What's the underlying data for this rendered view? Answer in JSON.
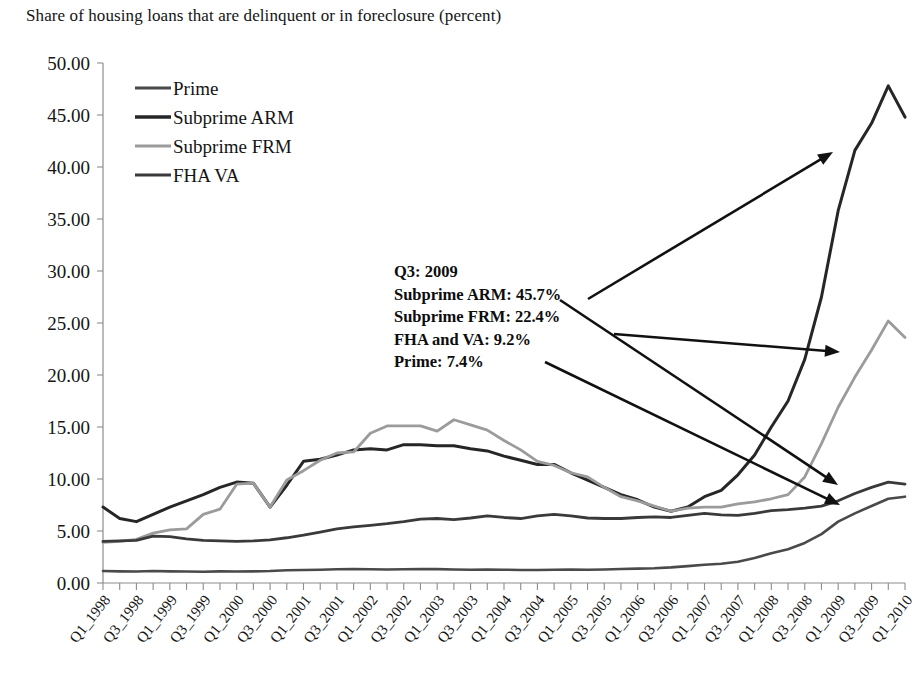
{
  "chart_data": {
    "type": "line",
    "title": "Share of housing loans that are delinquent or in foreclosure (percent)",
    "xlabel": "",
    "ylabel": "",
    "ylim": [
      0,
      50
    ],
    "ytick_step": 5,
    "grid": false,
    "legend_position": "top-left",
    "ytick_labels": [
      "0.00",
      "5.00",
      "10.00",
      "15.00",
      "20.00",
      "25.00",
      "30.00",
      "35.00",
      "40.00",
      "45.00",
      "50.00"
    ],
    "categories": [
      "Q1_1998",
      "Q2_1998",
      "Q3_1998",
      "Q4_1998",
      "Q1_1999",
      "Q2_1999",
      "Q3_1999",
      "Q4_1999",
      "Q1_2000",
      "Q2_2000",
      "Q3_2000",
      "Q4_2000",
      "Q1_2001",
      "Q2_2001",
      "Q3_2001",
      "Q4_2001",
      "Q1_2002",
      "Q2_2002",
      "Q3_2002",
      "Q4_2002",
      "Q1_2003",
      "Q2_2003",
      "Q3_2003",
      "Q4_2003",
      "Q1_2004",
      "Q2_2004",
      "Q3_2004",
      "Q4_2004",
      "Q1_2005",
      "Q2_2005",
      "Q3_2005",
      "Q4_2005",
      "Q1_2006",
      "Q2_2006",
      "Q3_2006",
      "Q4_2006",
      "Q1_2007",
      "Q2_2007",
      "Q3_2007",
      "Q4_2007",
      "Q1_2008",
      "Q2_2008",
      "Q3_2008",
      "Q4_2008",
      "Q1_2009",
      "Q2_2009",
      "Q3_2009",
      "Q4_2009",
      "Q1_2010"
    ],
    "xtick_labels_shown": [
      "Q1_1998",
      "Q3_1998",
      "Q1_1999",
      "Q3_1999",
      "Q1_2000",
      "Q3_2000",
      "Q1_2001",
      "Q3_2001",
      "Q1_2002",
      "Q3_2002",
      "Q1_2003",
      "Q3_2003",
      "Q1_2004",
      "Q3_2004",
      "Q1_2005",
      "Q3_2005",
      "Q1_2006",
      "Q3_2006",
      "Q1_2007",
      "Q3_2007",
      "Q1_2008",
      "Q3_2008",
      "Q1_2009",
      "Q3_2009",
      "Q1_2010"
    ],
    "series": [
      {
        "name": "Prime",
        "color": "#4a4a4a",
        "width": 2.6,
        "values": [
          1.15,
          1.12,
          1.1,
          1.15,
          1.12,
          1.1,
          1.08,
          1.12,
          1.1,
          1.12,
          1.15,
          1.22,
          1.25,
          1.28,
          1.32,
          1.35,
          1.32,
          1.3,
          1.32,
          1.35,
          1.33,
          1.3,
          1.28,
          1.3,
          1.28,
          1.25,
          1.25,
          1.28,
          1.3,
          1.28,
          1.3,
          1.35,
          1.38,
          1.42,
          1.5,
          1.62,
          1.75,
          1.85,
          2.05,
          2.4,
          2.85,
          3.25,
          3.85,
          4.7,
          5.9,
          6.7,
          7.4,
          8.1,
          8.3
        ]
      },
      {
        "name": "Subprime ARM",
        "color": "#262626",
        "width": 3.0,
        "values": [
          7.3,
          6.2,
          5.9,
          6.6,
          7.3,
          7.9,
          8.5,
          9.2,
          9.7,
          9.6,
          7.3,
          9.4,
          11.7,
          11.9,
          12.3,
          12.8,
          12.9,
          12.8,
          13.3,
          13.3,
          13.2,
          13.2,
          12.9,
          12.7,
          12.2,
          11.8,
          11.4,
          11.4,
          10.6,
          9.9,
          9.2,
          8.5,
          8.0,
          7.3,
          6.9,
          7.3,
          8.3,
          8.9,
          10.4,
          12.3,
          15.0,
          17.5,
          21.5,
          27.5,
          35.8,
          41.6,
          44.2,
          47.8,
          44.8
        ]
      },
      {
        "name": "Subprime FRM",
        "color": "#9b9b9b",
        "width": 2.8,
        "values": [
          3.9,
          4.0,
          4.2,
          4.8,
          5.1,
          5.2,
          6.6,
          7.1,
          9.5,
          9.6,
          7.3,
          9.9,
          10.8,
          11.8,
          12.5,
          12.6,
          14.4,
          15.1,
          15.1,
          15.1,
          14.6,
          15.7,
          15.2,
          14.7,
          13.7,
          12.8,
          11.7,
          11.3,
          10.6,
          10.2,
          9.2,
          8.3,
          7.9,
          7.4,
          6.9,
          7.2,
          7.3,
          7.3,
          7.6,
          7.8,
          8.1,
          8.5,
          10.2,
          13.4,
          16.9,
          19.8,
          22.4,
          25.2,
          23.6
        ]
      },
      {
        "name": "FHA VA",
        "color": "#3a3a3a",
        "width": 2.8,
        "values": [
          4.0,
          4.05,
          4.1,
          4.5,
          4.45,
          4.25,
          4.1,
          4.05,
          4.0,
          4.05,
          4.15,
          4.35,
          4.6,
          4.9,
          5.2,
          5.4,
          5.55,
          5.7,
          5.9,
          6.15,
          6.2,
          6.1,
          6.25,
          6.45,
          6.3,
          6.2,
          6.45,
          6.6,
          6.45,
          6.25,
          6.2,
          6.2,
          6.3,
          6.35,
          6.3,
          6.5,
          6.7,
          6.55,
          6.5,
          6.7,
          6.95,
          7.05,
          7.2,
          7.4,
          7.9,
          8.6,
          9.2,
          9.7,
          9.5
        ]
      }
    ],
    "annotation": {
      "lines": [
        "Q3: 2009",
        "Subprime ARM: 45.7%",
        "Subprime FRM: 22.4%",
        "FHA and VA: 9.2%",
        "Prime: 7.4%"
      ],
      "values": {
        "quarter": "Q3: 2009",
        "subprime_arm": "45.7%",
        "subprime_frm": "22.4%",
        "fha_and_va": "9.2%",
        "prime": "7.4%"
      }
    },
    "callout_arrows": [
      {
        "target": "subprime-arm-line",
        "x1": 588,
        "y1": 299,
        "x2": 833,
        "y2": 152
      },
      {
        "target": "subprime-frm-line",
        "x1": 614,
        "y1": 334,
        "x2": 840,
        "y2": 352
      },
      {
        "target": "fha-va-line",
        "x1": 560,
        "y1": 300,
        "x2": 838,
        "y2": 485
      },
      {
        "target": "prime-line",
        "x1": 545,
        "y1": 362,
        "x2": 840,
        "y2": 505
      }
    ]
  }
}
